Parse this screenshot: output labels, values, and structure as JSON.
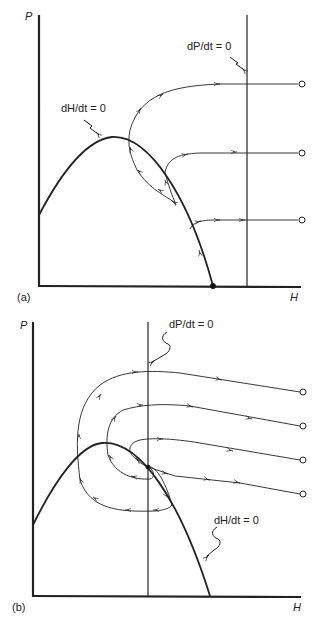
{
  "panels": [
    {
      "id": "a",
      "label": "(a)",
      "y_axis_label": "P",
      "x_axis_label": "H",
      "isocline_p": "dP/dt = 0",
      "isocline_h": "dH/dt = 0",
      "description": "Predator isocline to the right of the prey hump; trajectories converge to the prey isocline and then to the prey-only equilibrium on the H axis."
    },
    {
      "id": "b",
      "label": "(b)",
      "y_axis_label": "P",
      "x_axis_label": "H",
      "isocline_p": "dP/dt = 0",
      "isocline_h": "dH/dt = 0",
      "description": "Predator isocline to the right of the prey hump peak; trajectories spiral inward to a stable coexistence equilibrium at the intersection."
    }
  ]
}
